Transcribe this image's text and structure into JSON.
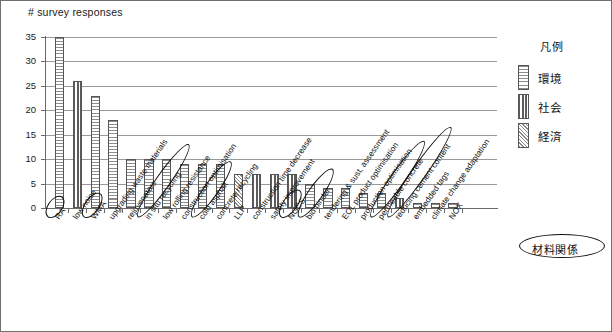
{
  "chart_data": {
    "type": "bar",
    "title": "# survey responses",
    "xlabel": "",
    "ylabel": "# survey responses",
    "ylim": [
      0,
      35
    ],
    "yticks": [
      0,
      5,
      10,
      15,
      20,
      25,
      30,
      35
    ],
    "grid": true,
    "legend_position": "right",
    "legend_title": "凡例",
    "legend_entries": [
      {
        "label": "環境",
        "pattern": "horizontal-stripes"
      },
      {
        "label": "社会",
        "pattern": "vertical-stripes"
      },
      {
        "label": "経済",
        "pattern": "diagonal-hatch"
      }
    ],
    "annotation": "材料関係",
    "categories": [
      "RA",
      "low noise",
      "WMA",
      "upgrading waste materials",
      "rejuvenators",
      "in situ recycling",
      "low rolling resistance",
      "construction optimisation",
      "cold asphalt",
      "concrete recycling",
      "LLP",
      "construction time decrease",
      "safety improvement",
      "NGCS",
      "bio binder",
      "tendering & sust. assessment",
      "EOL product optimisation",
      "production optimisation",
      "permeable concrete",
      "reducing cement content",
      "embedded tags",
      "climate change adaptation",
      "NOX"
    ],
    "values": [
      35,
      26,
      23,
      18,
      10,
      10,
      10,
      9,
      9,
      9,
      7,
      7,
      7,
      7,
      5,
      4,
      4,
      3,
      3,
      2,
      1,
      1,
      1
    ],
    "series_of_bar": [
      "環境",
      "社会",
      "環境",
      "環境",
      "環境",
      "環境",
      "環境",
      "環境",
      "環境",
      "環境",
      "経済",
      "社会",
      "社会",
      "社会",
      "環境",
      "環境",
      "環境",
      "環境",
      "環境",
      "社会",
      "環境",
      "環境",
      "環境"
    ],
    "circled_categories": [
      "RA",
      "WMA",
      "in situ recycling",
      "cold asphalt",
      "NGCS",
      "bio binder",
      "permeable concrete",
      "reducing cement content"
    ]
  }
}
